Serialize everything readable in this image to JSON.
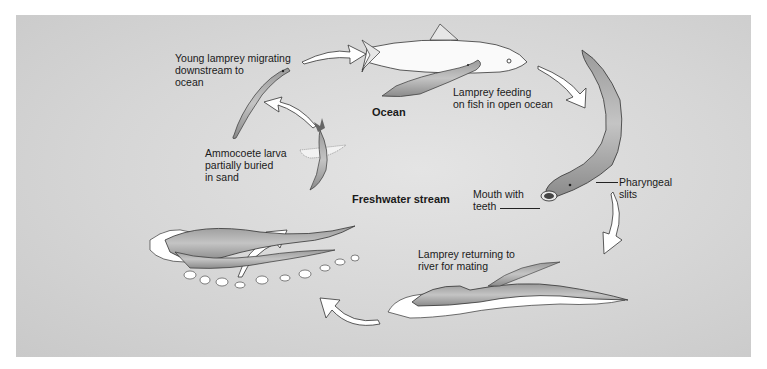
{
  "diagram": {
    "background_color": "#d6d6d6",
    "regions": {
      "ocean": "Ocean",
      "freshwater": "Freshwater stream"
    },
    "stages": [
      {
        "id": "young-migrating",
        "label": "Young lamprey migrating\ndownstream to\nocean"
      },
      {
        "id": "feeding",
        "label": "Lamprey feeding\non fish in open ocean"
      },
      {
        "id": "returning",
        "label": "Lamprey returning to\nriver for mating"
      },
      {
        "id": "larva",
        "label": "Ammocoete larva\npartially buried\nin sand"
      },
      {
        "id": "spawning",
        "label": ""
      }
    ],
    "anatomy_labels": {
      "mouth": "Mouth with\nteeth",
      "pharyngeal": "Pharyngeal\nslits"
    },
    "cycle_order": [
      "spawning",
      "larva",
      "young-migrating",
      "feeding",
      "returning",
      "spawning"
    ]
  }
}
